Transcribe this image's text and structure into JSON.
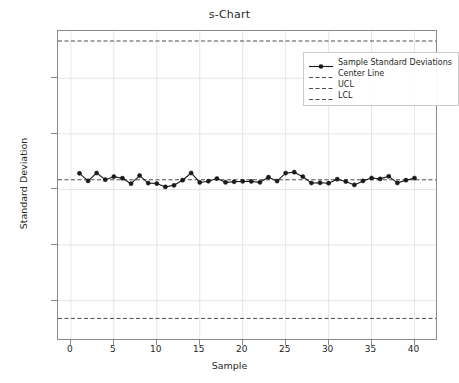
{
  "chart_data": {
    "type": "line",
    "title": "s-Chart",
    "xlabel": "Sample",
    "ylabel": "Standard Deviation",
    "xlim": [
      -1.5,
      42.5
    ],
    "ylim": [
      -0.1345,
      0.1425
    ],
    "grid": true,
    "legend_position": "upper right",
    "xticks": [
      0,
      5,
      10,
      15,
      20,
      25,
      30,
      35,
      40
    ],
    "xtick_labels": [
      "0",
      "5",
      "10",
      "15",
      "20",
      "25",
      "30",
      "35",
      "40"
    ],
    "yticks": [
      -0.1,
      -0.05,
      0.0,
      0.05,
      0.1
    ],
    "ytick_labels": [
      "−0.10",
      "−0.05",
      "0.00",
      "0.05",
      "0.10"
    ],
    "series": [
      {
        "name": "Sample Standard Deviations",
        "style": "line+marker",
        "color": "#1a1a1a",
        "x": [
          1,
          2,
          3,
          4,
          5,
          6,
          7,
          8,
          9,
          10,
          11,
          12,
          13,
          14,
          15,
          16,
          17,
          18,
          19,
          20,
          21,
          22,
          23,
          24,
          25,
          26,
          27,
          28,
          29,
          30,
          31,
          32,
          33,
          34,
          35,
          36,
          37,
          38,
          39,
          40
        ],
        "values": [
          0.0145,
          0.0077,
          0.0148,
          0.0088,
          0.0115,
          0.0101,
          0.0052,
          0.0125,
          0.0057,
          0.0053,
          0.0023,
          0.0037,
          0.0083,
          0.0148,
          0.0063,
          0.0074,
          0.0098,
          0.0064,
          0.0069,
          0.0073,
          0.0072,
          0.0064,
          0.011,
          0.0075,
          0.0147,
          0.0155,
          0.0115,
          0.0058,
          0.006,
          0.0056,
          0.0092,
          0.0071,
          0.0041,
          0.0077,
          0.0103,
          0.0095,
          0.0118,
          0.0059,
          0.0083,
          0.0102
        ]
      }
    ],
    "reference_lines": [
      {
        "name": "Center Line",
        "value": 0.0087,
        "style": "dashed",
        "color": "#4d4d4d"
      },
      {
        "name": "UCL",
        "value": 0.1335,
        "style": "dashed",
        "color": "#4d4d4d"
      },
      {
        "name": "LCL",
        "value": -0.116,
        "style": "dashed",
        "color": "#4d4d4d"
      }
    ],
    "legend_entries": [
      {
        "label": "Sample Standard Deviations",
        "type": "line+marker"
      },
      {
        "label": "Center Line",
        "type": "dashed"
      },
      {
        "label": "UCL",
        "type": "dashed"
      },
      {
        "label": "LCL",
        "type": "dashed"
      }
    ]
  }
}
